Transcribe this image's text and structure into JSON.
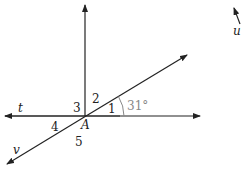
{
  "diagram": {
    "line_labels": {
      "t": "t",
      "v": "v",
      "u": "u"
    },
    "point_label": "A",
    "angle_labels": [
      "1",
      "2",
      "3",
      "4",
      "5"
    ],
    "angle_measure": "31°",
    "colors": {
      "line": "#222222",
      "measure": "#888888"
    }
  }
}
